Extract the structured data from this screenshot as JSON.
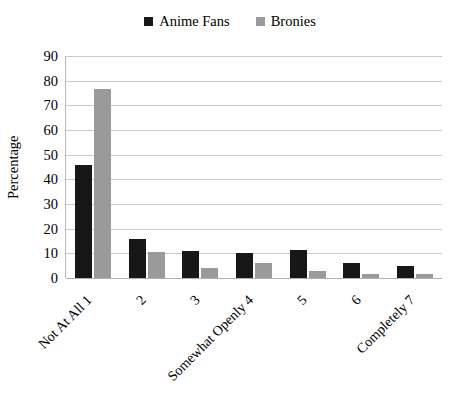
{
  "chart_data": {
    "type": "bar",
    "title": "",
    "xlabel": "",
    "ylabel": "Percentage",
    "ylim": [
      0,
      90
    ],
    "yticks": [
      0,
      10,
      20,
      30,
      40,
      50,
      60,
      70,
      80,
      90
    ],
    "grid": true,
    "legend_position": "top-center",
    "categories": [
      "Not At All 1",
      "2",
      "3",
      "Somewhat Openly 4",
      "5",
      "6",
      "Completely 7"
    ],
    "series": [
      {
        "name": "Anime Fans",
        "color": "#171717",
        "values": [
          46,
          16,
          11,
          10,
          11.5,
          6,
          5
        ]
      },
      {
        "name": "Bronies",
        "color": "#9a9a9a",
        "values": [
          76.5,
          10.5,
          4,
          6,
          3,
          1.5,
          1.5
        ]
      }
    ]
  }
}
